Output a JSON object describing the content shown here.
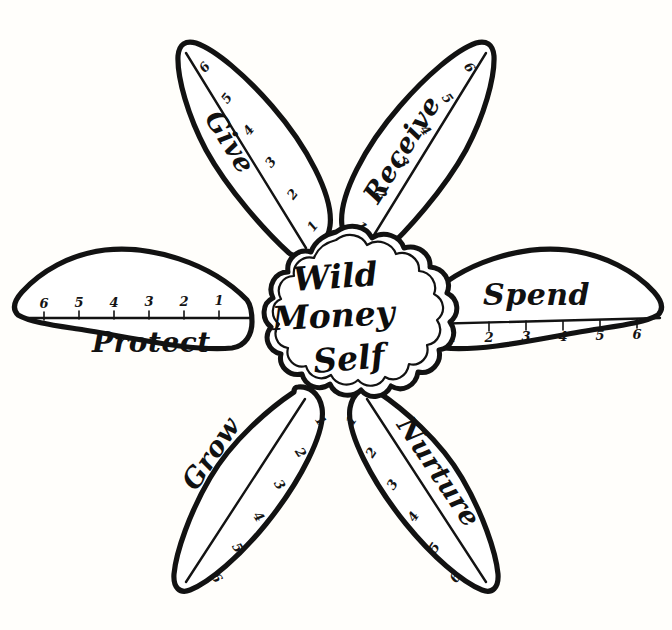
{
  "worksheet": {
    "title": "Wild Money Self",
    "center_lines": [
      "Wild",
      "Money",
      "Self"
    ],
    "scale_min": 1,
    "scale_max": 6,
    "ink_color": "#121212",
    "paper_color": "#ffffff"
  },
  "petals": [
    {
      "id": "give",
      "label": "Give",
      "position": "upper-left",
      "scale": [
        "1",
        "2",
        "3",
        "4",
        "5",
        "6"
      ],
      "scale_direction": "inward-to-outward"
    },
    {
      "id": "receive",
      "label": "Receive",
      "position": "upper-right",
      "scale": [
        "1",
        "2",
        "3",
        "4",
        "5",
        "6"
      ],
      "scale_direction": "inward-to-outward"
    },
    {
      "id": "spend",
      "label": "Spend",
      "position": "right",
      "scale": [
        "1",
        "2",
        "3",
        "4",
        "5",
        "6"
      ],
      "scale_direction": "inward-to-outward"
    },
    {
      "id": "nurture",
      "label": "Nurture",
      "position": "lower-right",
      "scale": [
        "1",
        "2",
        "3",
        "4",
        "5",
        "6"
      ],
      "scale_direction": "inward-to-outward"
    },
    {
      "id": "grow",
      "label": "Grow",
      "position": "lower-left",
      "scale": [
        "1",
        "2",
        "3",
        "4",
        "5",
        "6"
      ],
      "scale_direction": "inward-to-outward"
    },
    {
      "id": "protect",
      "label": "Protect",
      "position": "left",
      "scale": [
        "1",
        "2",
        "3",
        "4",
        "5",
        "6"
      ],
      "scale_direction": "inward-to-outward"
    }
  ]
}
